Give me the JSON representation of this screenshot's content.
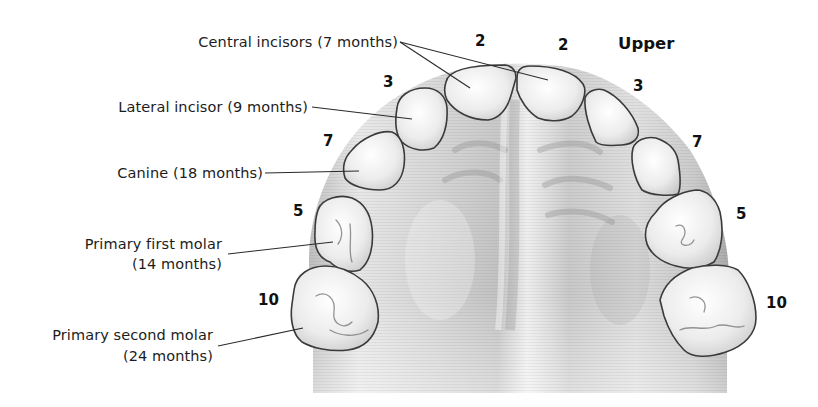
{
  "diagram": {
    "title": "Upper",
    "labels": {
      "central_incisors": "Central incisors (7 months)",
      "lateral_incisor": "Lateral incisor (9 months)",
      "canine": "Canine (18 months)",
      "first_molar_line1": "Primary first molar",
      "first_molar_line2": "(14 months)",
      "second_molar_line1": "Primary second molar",
      "second_molar_line2": "(24 months)"
    },
    "tooth_numbers": {
      "central_left": "2",
      "central_right": "2",
      "lateral_left": "3",
      "lateral_right": "3",
      "canine_left": "7",
      "canine_right": "7",
      "first_molar_left": "5",
      "first_molar_right": "5",
      "second_molar_left": "10",
      "second_molar_right": "10"
    },
    "colors": {
      "background": "#ffffff",
      "palate_light": "#e9e9e9",
      "palate_dark": "#9a9a9a",
      "tooth_fill": "#f4f4f4",
      "tooth_outline": "#3a3a3a",
      "leader_line": "#2a2a2a",
      "text": "#1c1c1c"
    }
  }
}
